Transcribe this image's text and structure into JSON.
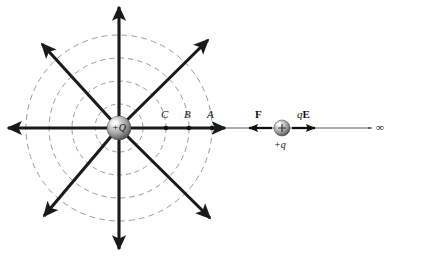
{
  "figure": {
    "colors": {
      "field_line": "#1a1a1a",
      "equipotential": "#8c8c8c",
      "axis": "#55555a",
      "sphere_light": "#f2f2f2",
      "sphere_mid": "#9a9a9a",
      "sphere_dark": "#4a4a4a",
      "text": "#111111",
      "background": "#ffffff"
    },
    "geometry": {
      "source_center_x": 119,
      "source_center_y": 128,
      "source_radius": 12,
      "test_center_x": 282,
      "test_center_y": 128,
      "test_radius": 8,
      "equipotential_radii": [
        24,
        47,
        70,
        93
      ],
      "field_line_count": 6
    },
    "source_charge": {
      "name": "source-charge",
      "label": "+Q"
    },
    "test_charge": {
      "name": "test-charge",
      "label": "+q",
      "glyph": "+"
    },
    "axis": {
      "name": "x-axis",
      "end_label": "∞"
    },
    "points": [
      {
        "id": "C",
        "label": "C",
        "x": 166,
        "y": 128,
        "label_x": 161,
        "label_y": 110
      },
      {
        "id": "B",
        "label": "B",
        "x": 189,
        "y": 128,
        "label_x": 184,
        "label_y": 110
      },
      {
        "id": "A",
        "label": "A",
        "x": 212,
        "y": 128,
        "label_x": 207,
        "label_y": 110
      }
    ],
    "vectors": [
      {
        "id": "force",
        "label": "F",
        "label_x": 255,
        "label_y": 110,
        "direction": "left",
        "description": "Coulomb force on test charge"
      },
      {
        "id": "qE",
        "label_q": "q",
        "label_E": "E",
        "label_x": 300,
        "label_y": 110,
        "direction": "right",
        "description": "Electric force qE on test charge"
      }
    ]
  }
}
